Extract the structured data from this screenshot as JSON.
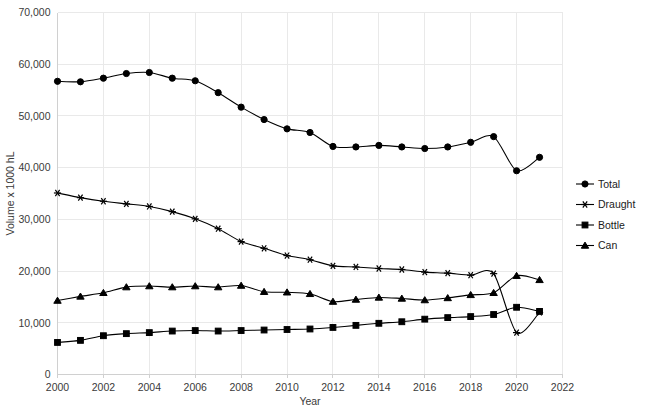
{
  "chart_data": {
    "type": "line",
    "title": "",
    "xlabel": "Year",
    "ylabel": "Volume x 1000 hL",
    "xlim": [
      2000,
      2022
    ],
    "ylim": [
      0,
      70000
    ],
    "xticks": [
      "2000",
      "2002",
      "2004",
      "2006",
      "2008",
      "2010",
      "2012",
      "2014",
      "2016",
      "2018",
      "2020",
      "2022"
    ],
    "yticks": [
      "0",
      "10,000",
      "20,000",
      "30,000",
      "40,000",
      "50,000",
      "60,000",
      "70,000"
    ],
    "grid": true,
    "legend_position": "right",
    "x": [
      2000,
      2001,
      2002,
      2003,
      2004,
      2005,
      2006,
      2007,
      2008,
      2009,
      2010,
      2011,
      2012,
      2013,
      2014,
      2015,
      2016,
      2017,
      2018,
      2019,
      2020,
      2021
    ],
    "series": [
      {
        "name": "Total",
        "marker": "circle",
        "values": [
          56700,
          56600,
          57300,
          58200,
          58400,
          57300,
          56800,
          54500,
          51700,
          49300,
          47500,
          46800,
          44100,
          44000,
          44300,
          44000,
          43700,
          44000,
          44900,
          46000,
          39400,
          42000
        ]
      },
      {
        "name": "Draught",
        "marker": "star",
        "values": [
          35100,
          34200,
          33500,
          33000,
          32500,
          31500,
          30100,
          28200,
          25700,
          24400,
          23000,
          22200,
          21000,
          20800,
          20500,
          20300,
          19800,
          19600,
          19200,
          19500,
          8100,
          12000
        ]
      },
      {
        "name": "Bottle",
        "marker": "square",
        "values": [
          6200,
          6600,
          7500,
          7900,
          8100,
          8400,
          8500,
          8400,
          8500,
          8600,
          8700,
          8800,
          9100,
          9500,
          9900,
          10200,
          10700,
          11000,
          11200,
          11600,
          13000,
          12200
        ]
      },
      {
        "name": "Can",
        "marker": "triangle",
        "values": [
          14300,
          15100,
          15800,
          16900,
          17100,
          16900,
          17100,
          16900,
          17200,
          16000,
          15900,
          15600,
          14100,
          14500,
          14900,
          14700,
          14400,
          14800,
          15400,
          15800,
          19100,
          18300
        ]
      }
    ]
  },
  "legend": {
    "items": [
      {
        "label": "Total",
        "marker": "circle"
      },
      {
        "label": "Draught",
        "marker": "star"
      },
      {
        "label": "Bottle",
        "marker": "square"
      },
      {
        "label": "Can",
        "marker": "triangle"
      }
    ]
  },
  "colors": {
    "series": "#000000",
    "grid": "#e9e9e9",
    "axis": "#d0d0d0",
    "text": "#3a3a3a",
    "background": "#ffffff"
  }
}
